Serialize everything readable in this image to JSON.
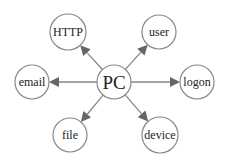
{
  "diagram": {
    "center": {
      "id": "pc",
      "label": "PC",
      "x": 114,
      "y": 82,
      "r": 17,
      "font_size": 19
    },
    "nodes": [
      {
        "id": "http",
        "label": "HTTP",
        "x": 68,
        "y": 32,
        "r": 18,
        "font_size": 12
      },
      {
        "id": "user",
        "label": "user",
        "x": 159,
        "y": 32,
        "r": 17,
        "font_size": 12
      },
      {
        "id": "email",
        "label": "email",
        "x": 32,
        "y": 82,
        "r": 17,
        "font_size": 12
      },
      {
        "id": "logon",
        "label": "logon",
        "x": 197,
        "y": 82,
        "r": 17,
        "font_size": 12
      },
      {
        "id": "file",
        "label": "file",
        "x": 70,
        "y": 135,
        "r": 17,
        "font_size": 12
      },
      {
        "id": "device",
        "label": "device",
        "x": 160,
        "y": 135,
        "r": 18,
        "font_size": 12
      }
    ],
    "edges": [
      {
        "from": "pc",
        "to": "http"
      },
      {
        "from": "pc",
        "to": "user"
      },
      {
        "from": "pc",
        "to": "email"
      },
      {
        "from": "pc",
        "to": "logon"
      },
      {
        "from": "pc",
        "to": "file"
      },
      {
        "from": "pc",
        "to": "device"
      }
    ],
    "colors": {
      "circle_stroke": "#888888",
      "circle_fill": "#ffffff",
      "edge": "#888888",
      "arrow": "#666666",
      "text": "#222222"
    }
  }
}
